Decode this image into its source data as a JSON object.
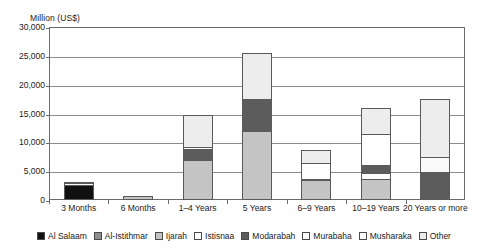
{
  "chart_data": {
    "type": "bar",
    "subtype": "stacked-vertical",
    "title": "",
    "ylabel": "Million (US$)",
    "xlabel": "",
    "ylim": [
      0,
      30000
    ],
    "ytick_labels": [
      "0",
      "5,000",
      "10,000",
      "15,000",
      "20,000",
      "25,000",
      "30,000"
    ],
    "ytick_values": [
      0,
      5000,
      10000,
      15000,
      20000,
      25000,
      30000
    ],
    "grid": true,
    "legend_position": "bottom",
    "categories": [
      "3 Months",
      "6 Months",
      "1–4 Years",
      "5 Years",
      "6–9 Years",
      "10–19 Years",
      "20 Years or more"
    ],
    "series": [
      {
        "name": "Al Salaam",
        "color": "#111111",
        "values": [
          2600,
          0,
          0,
          0,
          0,
          0,
          0
        ]
      },
      {
        "name": "Al-Istithmar",
        "color": "#8f8f8f",
        "values": [
          0,
          0,
          0,
          0,
          0,
          0,
          0
        ]
      },
      {
        "name": "Ijarah",
        "color": "#c4c4c4",
        "values": [
          0,
          700,
          6900,
          11900,
          3400,
          3700,
          0
        ]
      },
      {
        "name": "Istisnaa",
        "color": "#ffffff",
        "values": [
          0,
          0,
          0,
          0,
          0,
          1000,
          0
        ]
      },
      {
        "name": "Modarabah",
        "color": "#5c5c5c",
        "values": [
          0,
          0,
          1900,
          5600,
          300,
          1300,
          4900
        ]
      },
      {
        "name": "Murabaha",
        "color": "#ffffff",
        "values": [
          0,
          0,
          400,
          0,
          2800,
          5500,
          0
        ]
      },
      {
        "name": "Musharaka",
        "color": "#fafafa",
        "values": [
          300,
          0,
          0,
          0,
          0,
          0,
          2600
        ]
      },
      {
        "name": "Other",
        "color": "#ededed",
        "values": [
          100,
          0,
          5500,
          8000,
          2100,
          4500,
          10100
        ]
      }
    ],
    "totals": [
      3000,
      700,
      14700,
      25500,
      8600,
      16000,
      17600
    ]
  },
  "legend": {
    "items": [
      {
        "label": "Al Salaam"
      },
      {
        "label": "Al-Istithmar"
      },
      {
        "label": "Ijarah"
      },
      {
        "label": "Istisnaa"
      },
      {
        "label": "Modarabah"
      },
      {
        "label": "Murabaha"
      },
      {
        "label": "Musharaka"
      },
      {
        "label": "Other"
      }
    ]
  }
}
